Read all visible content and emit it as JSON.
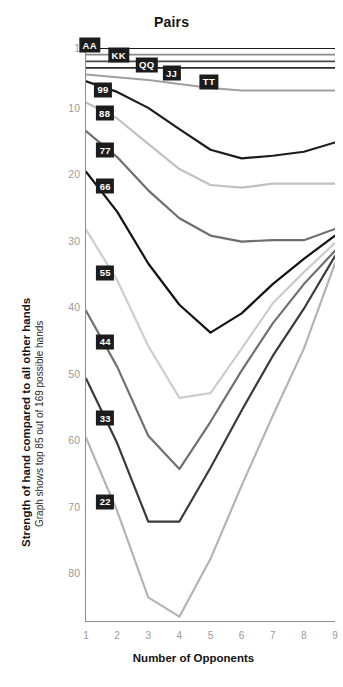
{
  "chart_data": {
    "type": "line",
    "title": "Pairs",
    "xlabel": "Number of Opponents",
    "ylabel": "Strength of hand compared to all other hands",
    "ylabel_sub": "Graph shows top 85 out of 169 possible hands",
    "x": [
      1,
      2,
      3,
      4,
      5,
      6,
      7,
      8,
      9
    ],
    "xticks": [
      "1",
      "2",
      "3",
      "4",
      "5",
      "6",
      "7",
      "8",
      "9"
    ],
    "yticks": [
      "1",
      "10",
      "20",
      "30",
      "40",
      "50",
      "60",
      "70",
      "80"
    ],
    "ytick_values": [
      1,
      10,
      20,
      30,
      40,
      50,
      60,
      70,
      80
    ],
    "ylim": [
      1,
      87
    ],
    "y_inverted": true,
    "xlim": [
      1,
      9
    ],
    "grid": false,
    "legend": "inline-labels",
    "series": [
      {
        "name": "AA",
        "color": "#1c1c1c",
        "width": 2.0,
        "values": [
          1,
          1,
          1,
          1,
          1,
          1,
          1,
          1,
          1
        ],
        "label_x": 1.12,
        "label_y": 0.6
      },
      {
        "name": "KK",
        "color": "#8a8a8a",
        "width": 1.8,
        "values": [
          2,
          2,
          2,
          2,
          2,
          2,
          2,
          2,
          2
        ],
        "label_x": 2.05,
        "label_y": 2.1
      },
      {
        "name": "QQ",
        "color": "#4a4a4a",
        "width": 1.8,
        "values": [
          3,
          3,
          3,
          3,
          3,
          3,
          3,
          3,
          3
        ],
        "label_x": 2.95,
        "label_y": 3.5
      },
      {
        "name": "JJ",
        "color": "#2a2a2a",
        "width": 1.8,
        "values": [
          4,
          4,
          4,
          4,
          4,
          4,
          4,
          4,
          4
        ],
        "label_x": 3.75,
        "label_y": 4.8
      },
      {
        "name": "TT",
        "color": "#a0a0a0",
        "width": 2.0,
        "values": [
          5,
          5.4,
          5.8,
          6.4,
          7,
          7.4,
          7.4,
          7.4,
          7.4
        ],
        "label_x": 4.95,
        "label_y": 6.1
      },
      {
        "name": "99",
        "color": "#1c1c1c",
        "width": 2.2,
        "values": [
          6,
          7.6,
          10,
          13.2,
          16.3,
          17.6,
          17.2,
          16.6,
          15.2
        ],
        "label_x": 1.55,
        "label_y": 7.3
      },
      {
        "name": "88",
        "color": "#c0c0c0",
        "width": 2.2,
        "values": [
          9.2,
          11.6,
          15.4,
          19.2,
          21.6,
          22,
          21.4,
          21.4,
          21.4
        ],
        "label_x": 1.6,
        "label_y": 10.8
      },
      {
        "name": "77",
        "color": "#6e6e6e",
        "width": 2.2,
        "values": [
          13.5,
          17.4,
          22.4,
          26.6,
          29.2,
          30.1,
          29.9,
          29.9,
          28.2
        ],
        "label_x": 1.62,
        "label_y": 16.4
      },
      {
        "name": "66",
        "color": "#121212",
        "width": 2.2,
        "values": [
          19.6,
          25.6,
          33.4,
          39.6,
          43.8,
          40.9,
          36.5,
          32.7,
          29.2
        ],
        "label_x": 1.62,
        "label_y": 21.8
      },
      {
        "name": "55",
        "color": "#cdcdcd",
        "width": 2.2,
        "values": [
          28.3,
          35.9,
          45.8,
          53.6,
          52.9,
          46.2,
          39.4,
          34.7,
          30.3
        ],
        "label_x": 1.62,
        "label_y": 34.8
      },
      {
        "name": "44",
        "color": "#707070",
        "width": 2.2,
        "values": [
          40.5,
          48.9,
          59.3,
          64.3,
          57.2,
          49.5,
          42.4,
          36.5,
          31.5
        ],
        "label_x": 1.62,
        "label_y": 45.2
      },
      {
        "name": "33",
        "color": "#3a3a3a",
        "width": 2.2,
        "values": [
          50.7,
          60.4,
          72.2,
          72.2,
          64.1,
          55.5,
          47.3,
          40.2,
          32.3
        ],
        "label_x": 1.62,
        "label_y": 56.7
      },
      {
        "name": "22",
        "color": "#b4b4b4",
        "width": 2.2,
        "values": [
          59.6,
          70.6,
          83.6,
          86.5,
          77.8,
          66.8,
          56.3,
          46.2,
          33.4
        ],
        "label_x": 1.62,
        "label_y": 69.2
      }
    ]
  }
}
